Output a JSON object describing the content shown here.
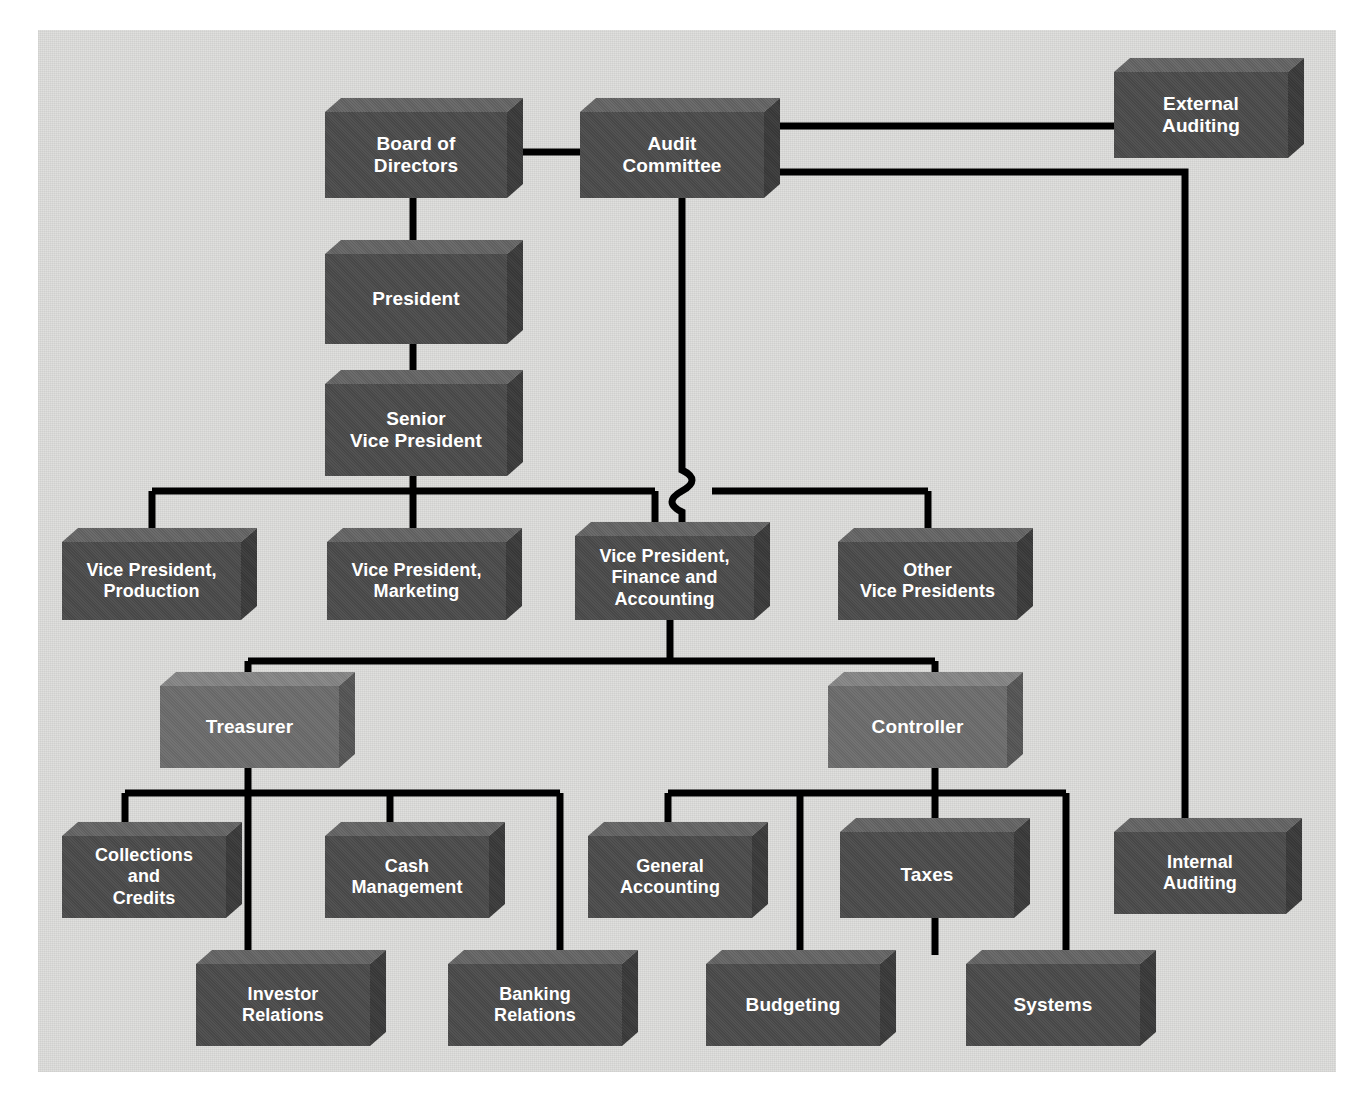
{
  "diagram": {
    "background_color": "#dededc",
    "page_color": "#ffffff",
    "box_fill_dark": "#4b4b4b",
    "box_fill_light": "#6d6d6d",
    "box_top_dark": "#646464",
    "box_side_dark": "#3a3a3a",
    "connector_color": "#000000",
    "label_color": "#ffffff"
  },
  "nodes": {
    "board_of_directors": "Board of\nDirectors",
    "audit_committee": "Audit\nCommittee",
    "external_auditing": "External\nAuditing",
    "president": "President",
    "senior_vice_president": "Senior\nVice President",
    "vp_production": "Vice President,\nProduction",
    "vp_marketing": "Vice President,\nMarketing",
    "vp_finance_accounting": "Vice President,\nFinance and\nAccounting",
    "other_vice_presidents": "Other\nVice Presidents",
    "treasurer": "Treasurer",
    "controller": "Controller",
    "collections_and_credits": "Collections\nand\nCredits",
    "cash_management": "Cash\nManagement",
    "general_accounting": "General\nAccounting",
    "taxes": "Taxes",
    "internal_auditing": "Internal\nAuditing",
    "investor_relations": "Investor\nRelations",
    "banking_relations": "Banking\nRelations",
    "budgeting": "Budgeting",
    "systems": "Systems"
  },
  "chart_data": {
    "type": "diagram",
    "nodes": [
      {
        "id": "board_of_directors",
        "label": "Board of Directors",
        "level": 0,
        "style": "dark"
      },
      {
        "id": "audit_committee",
        "label": "Audit Committee",
        "level": 0,
        "style": "dark"
      },
      {
        "id": "external_auditing",
        "label": "External Auditing",
        "level": 0,
        "style": "dark"
      },
      {
        "id": "president",
        "label": "President",
        "level": 1,
        "style": "dark"
      },
      {
        "id": "senior_vice_president",
        "label": "Senior Vice President",
        "level": 2,
        "style": "dark"
      },
      {
        "id": "vp_production",
        "label": "Vice President, Production",
        "level": 3,
        "style": "dark"
      },
      {
        "id": "vp_marketing",
        "label": "Vice President, Marketing",
        "level": 3,
        "style": "dark"
      },
      {
        "id": "vp_finance_accounting",
        "label": "Vice President, Finance and Accounting",
        "level": 3,
        "style": "dark"
      },
      {
        "id": "other_vice_presidents",
        "label": "Other Vice Presidents",
        "level": 3,
        "style": "dark"
      },
      {
        "id": "treasurer",
        "label": "Treasurer",
        "level": 4,
        "style": "light"
      },
      {
        "id": "controller",
        "label": "Controller",
        "level": 4,
        "style": "light"
      },
      {
        "id": "collections_and_credits",
        "label": "Collections and Credits",
        "level": 5,
        "style": "dark"
      },
      {
        "id": "cash_management",
        "label": "Cash Management",
        "level": 5,
        "style": "dark"
      },
      {
        "id": "general_accounting",
        "label": "General Accounting",
        "level": 5,
        "style": "dark"
      },
      {
        "id": "taxes",
        "label": "Taxes",
        "level": 5,
        "style": "dark"
      },
      {
        "id": "internal_auditing",
        "label": "Internal Auditing",
        "level": 5,
        "style": "dark"
      },
      {
        "id": "investor_relations",
        "label": "Investor Relations",
        "level": 6,
        "style": "dark"
      },
      {
        "id": "banking_relations",
        "label": "Banking Relations",
        "level": 6,
        "style": "dark"
      },
      {
        "id": "budgeting",
        "label": "Budgeting",
        "level": 6,
        "style": "dark"
      },
      {
        "id": "systems",
        "label": "Systems",
        "level": 6,
        "style": "dark"
      }
    ],
    "edges": [
      {
        "from": "board_of_directors",
        "to": "audit_committee",
        "kind": "horizontal"
      },
      {
        "from": "audit_committee",
        "to": "external_auditing",
        "kind": "horizontal"
      },
      {
        "from": "audit_committee",
        "to": "internal_auditing",
        "kind": "routed-right"
      },
      {
        "from": "audit_committee",
        "to": "vp_finance_accounting",
        "kind": "vertical-with-hop"
      },
      {
        "from": "board_of_directors",
        "to": "president",
        "kind": "vertical"
      },
      {
        "from": "president",
        "to": "senior_vice_president",
        "kind": "vertical"
      },
      {
        "from": "senior_vice_president",
        "to": "vp_production",
        "kind": "bus"
      },
      {
        "from": "senior_vice_president",
        "to": "vp_marketing",
        "kind": "bus"
      },
      {
        "from": "senior_vice_president",
        "to": "vp_finance_accounting",
        "kind": "bus"
      },
      {
        "from": "senior_vice_president",
        "to": "other_vice_presidents",
        "kind": "bus"
      },
      {
        "from": "vp_finance_accounting",
        "to": "treasurer",
        "kind": "bus"
      },
      {
        "from": "vp_finance_accounting",
        "to": "controller",
        "kind": "bus"
      },
      {
        "from": "treasurer",
        "to": "collections_and_credits",
        "kind": "bus"
      },
      {
        "from": "treasurer",
        "to": "cash_management",
        "kind": "bus"
      },
      {
        "from": "treasurer",
        "to": "investor_relations",
        "kind": "bus"
      },
      {
        "from": "treasurer",
        "to": "banking_relations",
        "kind": "bus"
      },
      {
        "from": "controller",
        "to": "general_accounting",
        "kind": "bus"
      },
      {
        "from": "controller",
        "to": "taxes",
        "kind": "bus"
      },
      {
        "from": "controller",
        "to": "budgeting",
        "kind": "bus"
      },
      {
        "from": "controller",
        "to": "systems",
        "kind": "bus"
      }
    ]
  }
}
